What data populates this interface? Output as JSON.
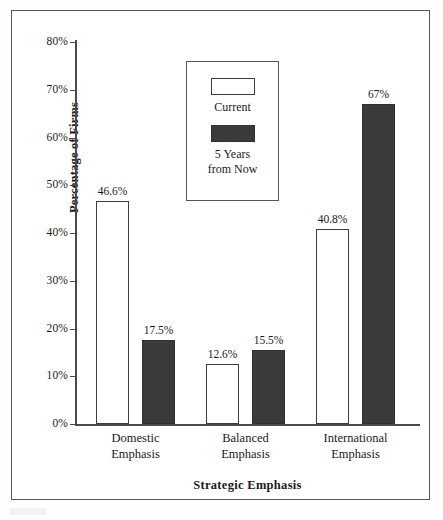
{
  "chart_data": {
    "type": "bar",
    "title": "",
    "xlabel": "Strategic Emphasis",
    "ylabel": "Percentage of Firms",
    "categories": [
      "Domestic Emphasis",
      "Balanced Emphasis",
      "International Emphasis"
    ],
    "category_lines": [
      [
        "Domestic",
        "Emphasis"
      ],
      [
        "Balanced",
        "Emphasis"
      ],
      [
        "International",
        "Emphasis"
      ]
    ],
    "series": [
      {
        "name": "Current",
        "values": [
          46.6,
          12.6,
          40.8
        ],
        "labels": [
          "46.6%",
          "12.6%",
          "40.8%"
        ],
        "color": "#ffffff",
        "border_color": "#3d3d3d"
      },
      {
        "name": "5 Years from Now",
        "values": [
          17.5,
          15.5,
          67.0
        ],
        "labels": [
          "17.5%",
          "15.5%",
          "67%"
        ],
        "color": "#3a3a3a",
        "border_color": "#303030"
      }
    ],
    "ylim": [
      0,
      80
    ],
    "yticks": [
      0,
      10,
      20,
      30,
      40,
      50,
      60,
      70,
      80
    ],
    "ytick_labels": [
      "0%",
      "10%",
      "20%",
      "30%",
      "40%",
      "50%",
      "60%",
      "70%",
      "80%"
    ],
    "grid": false,
    "legend_position": "top-center"
  },
  "legend": {
    "current_label": "Current",
    "future_label_line1": "5 Years",
    "future_label_line2": "from Now"
  }
}
